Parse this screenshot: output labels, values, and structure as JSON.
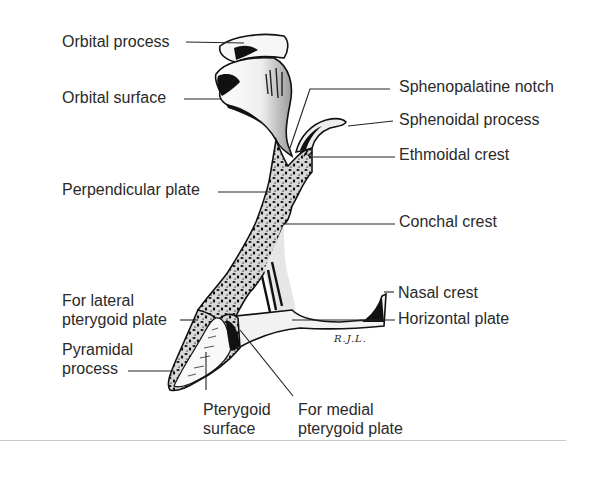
{
  "figure": {
    "signature": "R.J.L.",
    "colors": {
      "ink": "#111111",
      "text": "#2a2a2a",
      "bone_fill": "#f4f4f4",
      "rule": "#c8c8c8"
    }
  },
  "labels": {
    "orbital_process": "Orbital process",
    "orbital_surface": "Orbital surface",
    "perpendicular_plate": "Perpendicular plate",
    "sphenopalatine_notch": "Sphenopalatine notch",
    "sphenoidal_process": "Sphenoidal process",
    "ethmoidal_crest": "Ethmoidal crest",
    "conchal_crest": "Conchal crest",
    "nasal_crest": "Nasal crest",
    "horizontal_plate": "Horizontal plate",
    "for_lateral_pterygoid_plate": "For lateral\npterygoid plate",
    "pyramidal_process": "Pyramidal\nprocess",
    "pterygoid_surface": "Pterygoid\nsurface",
    "for_medial_pterygoid_plate": "For medial\npterygoid plate"
  }
}
